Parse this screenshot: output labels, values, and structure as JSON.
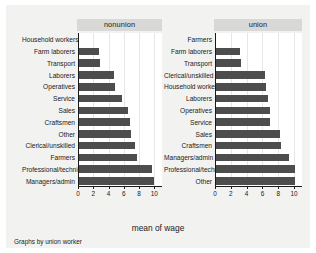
{
  "figure": {
    "xtitle": "mean of wage",
    "note": "Graphs by union worker",
    "bar_color": "#4d4d4d",
    "panel_title_bg": "#d8d8d6",
    "canvas_bg": "#f2f2f0",
    "plot_bg": "#ffffff"
  },
  "panels": [
    {
      "title": "nonunion"
    },
    {
      "title": "union"
    }
  ],
  "axis": {
    "ticks": [
      "0",
      "2",
      "4",
      "6",
      "8",
      "10"
    ],
    "tick_values": [
      0,
      2,
      4,
      6,
      8,
      10
    ],
    "min": 0,
    "max": 11
  },
  "chart_data": {
    "type": "bar",
    "orientation": "horizontal",
    "title": "",
    "xlabel": "mean of wage",
    "ylabel": "",
    "note": "Graphs by union worker",
    "xlim": [
      0,
      11
    ],
    "grid": true,
    "legend": "none",
    "panel_variable": "union worker",
    "panels": [
      {
        "name": "nonunion",
        "categories": [
          "Household workers",
          "Farm laborers",
          "Transport",
          "Laborers",
          "Operatives",
          "Service",
          "Sales",
          "Craftsmen",
          "Other",
          "Clerical/unskilled",
          "Farmers",
          "Professional/technical",
          "Managers/admin"
        ],
        "values": [
          0,
          2.8,
          2.9,
          4.7,
          4.8,
          5.7,
          6.5,
          6.8,
          6.9,
          7.4,
          7.7,
          9.7,
          10.0
        ]
      },
      {
        "name": "union",
        "categories": [
          "Farmers",
          "Farm laborers",
          "Transport",
          "Clerical/unskilled",
          "Household workers",
          "Laborers",
          "Operatives",
          "Service",
          "Sales",
          "Craftsmen",
          "Managers/admin",
          "Professional/technical",
          "Other"
        ],
        "values": [
          0,
          3.1,
          3.3,
          6.3,
          6.4,
          6.7,
          7.0,
          7.0,
          8.2,
          8.4,
          9.4,
          10.1,
          10.1
        ]
      }
    ]
  }
}
